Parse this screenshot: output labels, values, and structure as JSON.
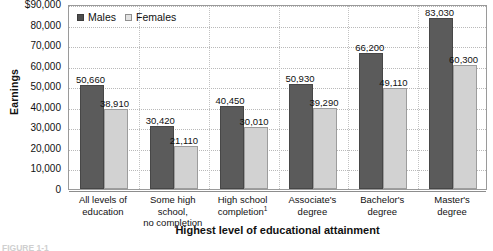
{
  "chart_data": {
    "type": "bar",
    "title": "",
    "xlabel": "Highest level of educational attainment",
    "ylabel": "Earnings",
    "ylim": [
      0,
      90000
    ],
    "grid": true,
    "legend_position": "top-left",
    "categories": [
      "All levels of education",
      "Some high school, no completion",
      "High school completion",
      "Associate's degree",
      "Bachelor's degree",
      "Master's degree"
    ],
    "category_lines": [
      [
        "All levels of",
        "education"
      ],
      [
        "Some high school,",
        "no completion"
      ],
      [
        "High school",
        "completion"
      ],
      [
        "Associate's",
        "degree"
      ],
      [
        "Bachelor's",
        "degree"
      ],
      [
        "Master's",
        "degree"
      ]
    ],
    "category_footnotes": [
      "",
      "",
      "1",
      "",
      "",
      ""
    ],
    "series": [
      {
        "name": "Males",
        "color": "#5b5b5b",
        "values": [
          50660,
          30420,
          40450,
          50930,
          66200,
          83030
        ],
        "labels": [
          "50,660",
          "30,420",
          "40,450",
          "50,930",
          "66,200",
          "83,030"
        ]
      },
      {
        "name": "Females",
        "color": "#d2d2d2",
        "values": [
          38910,
          21110,
          30010,
          39290,
          49110,
          60300
        ],
        "labels": [
          "38,910",
          "21,110",
          "30,010",
          "39,290",
          "49,110",
          "60,300"
        ]
      }
    ],
    "ytick_labels": [
      "$90,000",
      "80,000",
      "70,000",
      "60,000",
      "50,000",
      "40,000",
      "30,000",
      "20,000",
      "10,000",
      "0"
    ],
    "ytick_values": [
      90000,
      80000,
      70000,
      60000,
      50000,
      40000,
      30000,
      20000,
      10000,
      0
    ]
  },
  "legend": {
    "items": [
      {
        "label": "Males"
      },
      {
        "label": "Females"
      }
    ]
  },
  "caption": {
    "text": "FIGURE 1-1"
  }
}
